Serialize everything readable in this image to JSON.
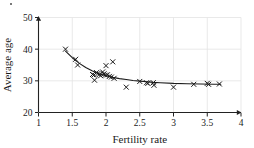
{
  "chart_data": {
    "type": "scatter",
    "title": "",
    "xlabel": "Fertility rate",
    "ylabel": "Average age",
    "xlim": [
      1,
      4
    ],
    "ylim": [
      20,
      50
    ],
    "xticks": [
      "1",
      "1.5",
      "2",
      "2.5",
      "3",
      "3.5",
      "4"
    ],
    "xtick_values": [
      1,
      1.5,
      2,
      2.5,
      3,
      3.5,
      4
    ],
    "yticks": [
      "20",
      "30",
      "40",
      "50"
    ],
    "ytick_values": [
      20,
      30,
      40,
      50
    ],
    "grid": true,
    "grid_color": "#e3e3e3",
    "legend": "none",
    "marker": "x",
    "marker_color": "#1a1a1a",
    "series": [
      {
        "name": "countries",
        "points": [
          [
            1.4,
            40.0
          ],
          [
            1.55,
            36.8
          ],
          [
            1.58,
            35.0
          ],
          [
            1.8,
            32.0
          ],
          [
            1.82,
            31.8
          ],
          [
            1.83,
            30.2
          ],
          [
            1.86,
            32.6
          ],
          [
            1.88,
            32.3
          ],
          [
            1.9,
            32.0
          ],
          [
            1.92,
            31.6
          ],
          [
            1.95,
            32.8
          ],
          [
            1.97,
            32.2
          ],
          [
            1.99,
            31.8
          ],
          [
            2.0,
            34.8
          ],
          [
            2.02,
            31.9
          ],
          [
            2.05,
            31.4
          ],
          [
            2.08,
            31.2
          ],
          [
            2.1,
            36.0
          ],
          [
            2.12,
            30.8
          ],
          [
            2.3,
            28.0
          ],
          [
            2.5,
            29.8
          ],
          [
            2.6,
            29.4
          ],
          [
            2.62,
            29.2
          ],
          [
            2.7,
            29.4
          ],
          [
            2.71,
            28.6
          ],
          [
            3.0,
            28.0
          ],
          [
            3.3,
            28.9
          ],
          [
            3.5,
            29.2
          ],
          [
            3.52,
            28.9
          ],
          [
            3.68,
            29.0
          ]
        ]
      }
    ],
    "fit_curve": {
      "name": "fitted trend",
      "color": "#1a1a1a",
      "points": [
        [
          1.4,
          39.4
        ],
        [
          1.5,
          37.3
        ],
        [
          1.6,
          35.6
        ],
        [
          1.7,
          34.2
        ],
        [
          1.8,
          33.1
        ],
        [
          1.9,
          32.2
        ],
        [
          2.0,
          31.6
        ],
        [
          2.1,
          31.1
        ],
        [
          2.2,
          30.7
        ],
        [
          2.3,
          30.4
        ],
        [
          2.4,
          30.1
        ],
        [
          2.5,
          29.9
        ],
        [
          2.6,
          29.7
        ],
        [
          2.7,
          29.5
        ],
        [
          2.8,
          29.4
        ],
        [
          3.0,
          29.2
        ],
        [
          3.2,
          29.1
        ],
        [
          3.4,
          29.0
        ],
        [
          3.6,
          28.9
        ],
        [
          3.7,
          28.9
        ]
      ]
    }
  }
}
